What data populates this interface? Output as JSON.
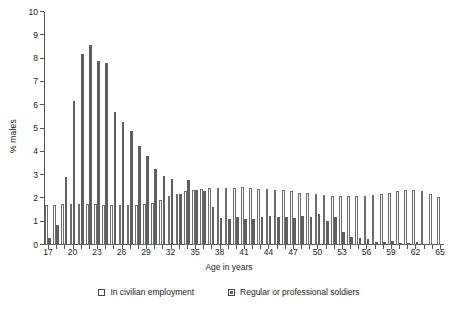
{
  "chart_data": {
    "type": "bar",
    "title": "",
    "xlabel": "Age in years",
    "ylabel": "% males",
    "ylim": [
      0,
      10
    ],
    "yticks": [
      0,
      1,
      2,
      3,
      4,
      5,
      6,
      7,
      8,
      9,
      10
    ],
    "xtick_labels": [
      "17",
      "20",
      "23",
      "26",
      "29",
      "32",
      "35",
      "38",
      "41",
      "44",
      "47",
      "50",
      "53",
      "56",
      "59",
      "62",
      "65"
    ],
    "xtick_step": 3,
    "grid": false,
    "legend_position": "bottom",
    "categories": [
      17,
      18,
      19,
      20,
      21,
      22,
      23,
      24,
      25,
      26,
      27,
      28,
      29,
      30,
      31,
      32,
      33,
      34,
      35,
      36,
      37,
      38,
      39,
      40,
      41,
      42,
      43,
      44,
      45,
      46,
      47,
      48,
      49,
      50,
      51,
      52,
      53,
      54,
      55,
      56,
      57,
      58,
      59,
      60,
      61,
      62,
      63,
      64,
      65
    ],
    "series": [
      {
        "name": "In civilian employment",
        "color": "#fdfdfd",
        "edge_color": "#6d6d6d",
        "values": [
          1.7,
          1.7,
          1.75,
          1.75,
          1.75,
          1.75,
          1.75,
          1.7,
          1.7,
          1.7,
          1.7,
          1.7,
          1.75,
          1.8,
          1.95,
          2.1,
          2.2,
          2.3,
          2.35,
          2.4,
          2.45,
          2.45,
          2.45,
          2.45,
          2.5,
          2.45,
          2.4,
          2.4,
          2.35,
          2.35,
          2.3,
          2.25,
          2.25,
          2.2,
          2.15,
          2.1,
          2.1,
          2.1,
          2.1,
          2.1,
          2.15,
          2.2,
          2.25,
          2.3,
          2.35,
          2.35,
          2.3,
          2.2,
          2.05
        ]
      },
      {
        "name": "Regular or professional soldiers",
        "color": "#5f5f5f",
        "values": [
          0.3,
          0.85,
          2.9,
          6.2,
          8.2,
          8.6,
          7.9,
          7.8,
          5.7,
          5.3,
          4.9,
          4.25,
          3.8,
          3.25,
          2.95,
          2.85,
          2.2,
          2.8,
          2.35,
          2.3,
          1.65,
          1.15,
          1.1,
          1.2,
          1.1,
          1.1,
          1.2,
          1.25,
          1.2,
          1.2,
          1.15,
          1.25,
          1.2,
          1.35,
          1.05,
          1.2,
          0.55,
          0.35,
          0.3,
          0.25,
          0.15,
          0.15,
          0.18,
          0.1,
          0.08,
          0.12,
          0.05,
          0.04,
          0.03
        ]
      }
    ]
  }
}
